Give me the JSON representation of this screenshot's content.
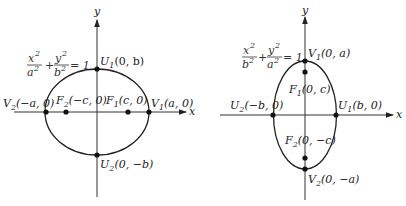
{
  "figures": [
    {
      "id": "horizontal",
      "axes": {
        "x_label": "x",
        "y_label": "y"
      },
      "equation": {
        "x_num": "x",
        "x_den": "a",
        "y_num": "y",
        "y_den": "b",
        "rhs": "= 1",
        "plus": "+"
      },
      "points": {
        "U1": {
          "name": "U",
          "sub": "1",
          "coords": "(0, b)"
        },
        "U2": {
          "name": "U",
          "sub": "2",
          "coords": "(0, −b)"
        },
        "V1": {
          "name": "V",
          "sub": "1",
          "coords": "(a, 0)"
        },
        "V2": {
          "name": "V",
          "sub": "2",
          "coords": "(−a, 0)"
        },
        "F1": {
          "name": "F",
          "sub": "1",
          "coords": "(c, 0)"
        },
        "F2": {
          "name": "F",
          "sub": "2",
          "coords": "(−c, 0)"
        }
      }
    },
    {
      "id": "vertical",
      "axes": {
        "x_label": "x",
        "y_label": "y"
      },
      "equation": {
        "x_num": "x",
        "x_den": "b",
        "y_num": "y",
        "y_den": "a",
        "rhs": "= 1",
        "plus": "+"
      },
      "points": {
        "V1": {
          "name": "V",
          "sub": "1",
          "coords": "(0, a)"
        },
        "V2": {
          "name": "V",
          "sub": "2",
          "coords": "(0, −a)"
        },
        "U1": {
          "name": "U",
          "sub": "1",
          "coords": "(b, 0)"
        },
        "U2": {
          "name": "U",
          "sub": "2",
          "coords": "(−b, 0)"
        },
        "F1": {
          "name": "F",
          "sub": "1",
          "coords": "(0, c)"
        },
        "F2": {
          "name": "F",
          "sub": "2",
          "coords": "(0, −c)"
        }
      }
    }
  ],
  "sup2": "2"
}
